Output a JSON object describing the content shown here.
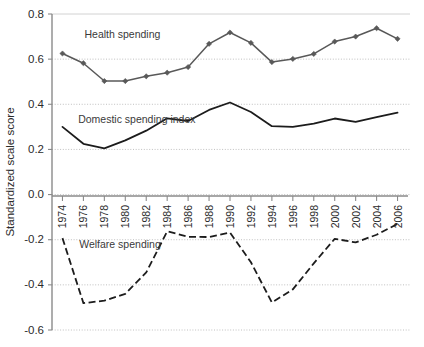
{
  "chart_data": {
    "type": "line",
    "title": "",
    "xlabel": "",
    "ylabel": "Standardized scale score",
    "ylim": [
      -0.6,
      0.8
    ],
    "ytick_labels": [
      "0.8",
      "0.6",
      "0.4",
      "0.2",
      "0.0",
      "-0.2",
      "-0.4",
      "-0.6"
    ],
    "ytick_values": [
      0.8,
      0.6,
      0.4,
      0.2,
      0.0,
      -0.2,
      -0.4,
      -0.6
    ],
    "grid": true,
    "legend_position": "inline-annotations",
    "xlim": [
      1973,
      2007
    ],
    "x": [
      1974,
      1976,
      1978,
      1980,
      1982,
      1984,
      1986,
      1988,
      1990,
      1992,
      1994,
      1996,
      1998,
      2000,
      2002,
      2004,
      2006
    ],
    "xtick_labels": [
      "1974",
      "1976",
      "1978",
      "1980",
      "1982",
      "1984",
      "1986",
      "1988",
      "1990",
      "1992",
      "1994",
      "1996",
      "1998",
      "2000",
      "2002",
      "2004",
      "2006"
    ],
    "series": [
      {
        "name": "Health spending",
        "style": "solid-markers",
        "color": "#595959",
        "label_x": 1976.1,
        "label_y": 0.695,
        "values": [
          0.625,
          0.582,
          0.503,
          0.503,
          0.524,
          0.54,
          0.565,
          0.668,
          0.718,
          0.672,
          0.587,
          0.601,
          0.623,
          0.678,
          0.7,
          0.737,
          0.69
        ]
      },
      {
        "name": "Domestic spending index",
        "style": "solid",
        "color": "#1c1c1c",
        "label_x": 1975.5,
        "label_y": 0.318,
        "values": [
          0.3,
          0.225,
          0.205,
          0.24,
          0.283,
          0.338,
          0.326,
          0.375,
          0.408,
          0.366,
          0.303,
          0.3,
          0.314,
          0.337,
          0.322,
          0.343,
          0.363
        ]
      },
      {
        "name": "Welfare spending",
        "style": "dashed",
        "color": "#1c1c1c",
        "label_x": 1975.6,
        "label_y": -0.236,
        "values": [
          -0.193,
          -0.481,
          -0.47,
          -0.44,
          -0.345,
          -0.163,
          -0.187,
          -0.188,
          -0.168,
          -0.3,
          -0.478,
          -0.42,
          -0.305,
          -0.196,
          -0.212,
          -0.178,
          -0.13
        ]
      }
    ]
  }
}
